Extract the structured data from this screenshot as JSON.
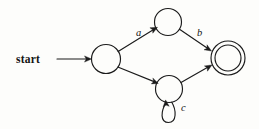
{
  "diagram": {
    "kind": "finite-automaton",
    "title": "",
    "background_color": "#fdfdfb",
    "stroke_color": "#1b1b1b",
    "start_label": "start",
    "states": [
      {
        "id": "q0",
        "label": "",
        "role": "initial",
        "cx": 106,
        "cy": 59,
        "r": 14.5,
        "accepting": false
      },
      {
        "id": "q1",
        "label": "",
        "role": "intermediate-top",
        "cx": 168,
        "cy": 22,
        "r": 13.5,
        "accepting": false
      },
      {
        "id": "q2",
        "label": "",
        "role": "intermediate-bottom",
        "cx": 169,
        "cy": 89,
        "r": 13.5,
        "accepting": false
      },
      {
        "id": "q3",
        "label": "",
        "role": "accepting",
        "cx": 228,
        "cy": 58,
        "r": 17,
        "inner_r": 13,
        "accepting": true
      }
    ],
    "transitions": [
      {
        "from": "q0",
        "to": "q1",
        "label": "a",
        "label_x": 136,
        "label_y": 36
      },
      {
        "from": "q1",
        "to": "q3",
        "label": "b",
        "label_x": 197,
        "label_y": 36
      },
      {
        "from": "q0",
        "to": "q2",
        "label": "",
        "label_x": 0,
        "label_y": 0
      },
      {
        "from": "q2",
        "to": "q2",
        "label": "c",
        "label_x": 181,
        "label_y": 111,
        "self_loop": true
      },
      {
        "from": "q2",
        "to": "q3",
        "label": "",
        "label_x": 0,
        "label_y": 0
      }
    ],
    "start_arrow": {
      "x1": 57,
      "y1": 59,
      "x2": 91,
      "y2": 59
    },
    "start_text_x": 16,
    "start_text_y": 63
  }
}
